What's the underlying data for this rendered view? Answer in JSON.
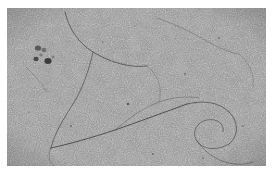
{
  "figure": {
    "kind": "electron-micrograph",
    "modality": "transmission electron microscopy",
    "alt_text": "Grainy gray electron micrograph showing thin dark filamentous strands tracing long curved paths across a noisy carbon support film, with a small cluster of dark stain particles at upper left."
  },
  "canvas": {
    "width": 274,
    "height": 175,
    "page_background": "#ffffff"
  },
  "micrograph": {
    "x": 7,
    "y": 8,
    "width": 259,
    "height": 158,
    "base_gray": "#8b8b8b",
    "grain": {
      "type": "film-grain",
      "base_frequency": 0.92,
      "octaves": 4,
      "contrast": 0.62,
      "seed": 17
    },
    "tone": {
      "highlight": "#b4b4b4",
      "midtone": "#8b8b8b",
      "shadow": "#5c5c5c",
      "darkest": "#2e2e2e"
    },
    "vignette": {
      "enabled": true,
      "edge_darkening": 0.16
    }
  },
  "features": {
    "filaments": [
      {
        "id": "filament-1",
        "label": "upper-left arc",
        "path": "M 58 4 C 62 20, 70 34, 86 44 C 104 55, 124 60, 140 58",
        "stroke": "#3a3a3a",
        "width": 0.85,
        "opacity": 0.78
      },
      {
        "id": "filament-2",
        "label": "long descending strand",
        "path": "M 86 44 C 82 62, 76 80, 66 96 C 56 112, 48 124, 44 140",
        "stroke": "#3a3a3a",
        "width": 0.85,
        "opacity": 0.72
      },
      {
        "id": "filament-3",
        "label": "lower sweeping diagonal",
        "path": "M 44 140 C 62 136, 84 130, 108 122 C 134 113, 158 104, 180 96",
        "stroke": "#333333",
        "width": 0.95,
        "opacity": 0.8
      },
      {
        "id": "filament-4",
        "label": "right loop upper",
        "path": "M 180 96 C 196 92, 212 94, 222 104 C 232 114, 232 128, 222 136",
        "stroke": "#3a3a3a",
        "width": 0.85,
        "opacity": 0.74
      },
      {
        "id": "filament-5",
        "label": "right loop lower",
        "path": "M 222 136 C 210 143, 196 142, 190 133 C 184 124, 190 114, 200 112 C 210 110, 218 116, 216 124",
        "stroke": "#3a3a3a",
        "width": 0.8,
        "opacity": 0.7
      },
      {
        "id": "filament-6",
        "label": "top right faint strand",
        "path": "M 150 10 C 168 16, 184 24, 198 32 C 210 39, 220 44, 232 46",
        "stroke": "#4a4a4a",
        "width": 0.7,
        "opacity": 0.5
      },
      {
        "id": "filament-7",
        "label": "mid crossing strand",
        "path": "M 108 122 C 122 110, 136 100, 152 94 C 166 89, 180 88, 192 90",
        "stroke": "#404040",
        "width": 0.7,
        "opacity": 0.52
      },
      {
        "id": "filament-8",
        "label": "lower right tail",
        "path": "M 190 133 C 196 142, 206 150, 218 154 C 228 157, 238 157, 246 154",
        "stroke": "#3f3f3f",
        "width": 0.75,
        "opacity": 0.58
      },
      {
        "id": "filament-9",
        "label": "left short strand",
        "path": "M 18 58 C 26 66, 34 74, 40 84",
        "stroke": "#484848",
        "width": 0.65,
        "opacity": 0.45
      },
      {
        "id": "filament-10",
        "label": "bottom left curl",
        "path": "M 44 140 C 40 148, 42 156, 50 160",
        "stroke": "#444444",
        "width": 0.7,
        "opacity": 0.5
      },
      {
        "id": "filament-11",
        "label": "far right faint arc",
        "path": "M 232 46 C 242 54, 248 66, 246 80",
        "stroke": "#4c4c4c",
        "width": 0.65,
        "opacity": 0.42
      },
      {
        "id": "filament-12",
        "label": "centre faint loop",
        "path": "M 140 58 C 150 66, 156 78, 152 94",
        "stroke": "#4a4a4a",
        "width": 0.65,
        "opacity": 0.44
      }
    ],
    "particle_cluster": {
      "label": "stain particle cluster",
      "region": {
        "x": 22,
        "y": 34,
        "width": 34,
        "height": 28
      },
      "particles": [
        {
          "cx": 31,
          "cy": 40,
          "rx": 3.2,
          "ry": 2.6,
          "fill": "#3c3c3c",
          "opacity": 0.72
        },
        {
          "cx": 37,
          "cy": 42,
          "rx": 2.4,
          "ry": 2.2,
          "fill": "#4a4a4a",
          "opacity": 0.6
        },
        {
          "cx": 29,
          "cy": 51,
          "rx": 2.6,
          "ry": 2.2,
          "fill": "#2f2f2f",
          "opacity": 0.8
        },
        {
          "cx": 41,
          "cy": 53,
          "rx": 3.6,
          "ry": 3.0,
          "fill": "#2a2a2a",
          "opacity": 0.86
        },
        {
          "cx": 34,
          "cy": 47,
          "rx": 1.8,
          "ry": 1.6,
          "fill": "#555555",
          "opacity": 0.5
        },
        {
          "cx": 46,
          "cy": 49,
          "rx": 1.6,
          "ry": 1.4,
          "fill": "#505050",
          "opacity": 0.45
        }
      ]
    },
    "specks": [
      {
        "cx": 121,
        "cy": 96,
        "r": 1.3,
        "fill": "#383838",
        "opacity": 0.7
      },
      {
        "cx": 178,
        "cy": 66,
        "r": 0.9,
        "fill": "#404040",
        "opacity": 0.55
      },
      {
        "cx": 96,
        "cy": 34,
        "r": 0.8,
        "fill": "#444444",
        "opacity": 0.5
      },
      {
        "cx": 212,
        "cy": 30,
        "r": 0.9,
        "fill": "#3e3e3e",
        "opacity": 0.52
      },
      {
        "cx": 64,
        "cy": 118,
        "r": 1.0,
        "fill": "#3a3a3a",
        "opacity": 0.58
      },
      {
        "cx": 236,
        "cy": 118,
        "r": 0.9,
        "fill": "#424242",
        "opacity": 0.5
      },
      {
        "cx": 146,
        "cy": 146,
        "r": 1.1,
        "fill": "#3c3c3c",
        "opacity": 0.55
      },
      {
        "cx": 22,
        "cy": 104,
        "r": 0.8,
        "fill": "#464646",
        "opacity": 0.45
      },
      {
        "cx": 196,
        "cy": 150,
        "r": 0.9,
        "fill": "#404040",
        "opacity": 0.48
      },
      {
        "cx": 128,
        "cy": 18,
        "r": 0.8,
        "fill": "#484848",
        "opacity": 0.42
      }
    ]
  },
  "scale_bar": {
    "visible": false,
    "label": ""
  },
  "annotations": {
    "visible": false,
    "items": []
  }
}
